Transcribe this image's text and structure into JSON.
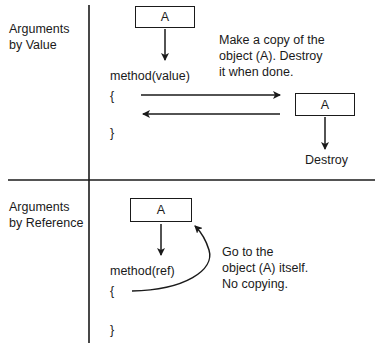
{
  "sections": [
    {
      "label_line1": "Arguments",
      "label_line2": "by Value",
      "top_box": "A",
      "method": "method(value)",
      "open_brace": "{",
      "close_brace": "}",
      "note_line1": "Make a copy of the",
      "note_line2": "object (A). Destroy",
      "note_line3": "it when done.",
      "copy_box": "A",
      "destroy": "Destroy"
    },
    {
      "label_line1": "Arguments",
      "label_line2": "by Reference",
      "top_box": "A",
      "method": "method(ref)",
      "open_brace": "{",
      "close_brace": "}",
      "note_line1": "Go to the",
      "note_line2": "object (A) itself.",
      "note_line3": "No copying."
    }
  ],
  "colors": {
    "ink": "#1a1a1a",
    "background": "#ffffff"
  }
}
